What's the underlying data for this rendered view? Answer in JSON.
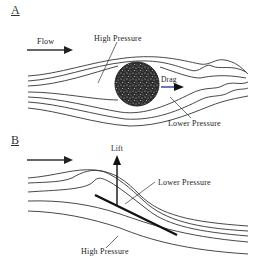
{
  "panels": [
    {
      "label": "A",
      "flow_label": "Flow",
      "high_pressure_label": "High Pressure",
      "drag_label": "Drag",
      "lower_pressure_label": "Lower Pressure"
    },
    {
      "label": "B",
      "lift_label": "Lift",
      "lower_pressure_label": "Lower Pressure",
      "high_pressure_label": "High Pressure"
    }
  ],
  "colors": {
    "line": "#333333",
    "drag_arrow_shaft": "#2a3f9a",
    "sphere": "#3a3a3a"
  }
}
